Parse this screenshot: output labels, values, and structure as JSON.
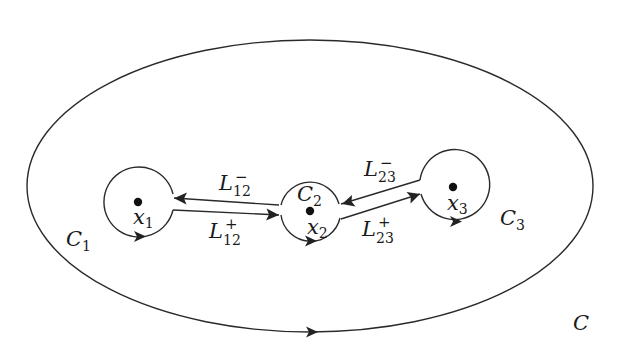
{
  "diagram": {
    "type": "contour-diagram",
    "outer_contour": {
      "label": "C",
      "center": [
        310,
        186
      ],
      "rx": 283,
      "ry": 146,
      "orientation": "counterclockwise-arrow-at-bottom-pointing-right"
    },
    "circles": [
      {
        "id": "C1",
        "label": "C",
        "label_sub": "1",
        "center": [
          139,
          202
        ],
        "r": 35,
        "point": {
          "label": "x",
          "label_sub": "1",
          "pos": [
            138,
            202
          ]
        }
      },
      {
        "id": "C2",
        "label": "C",
        "label_sub": "2",
        "center": [
          311,
          211
        ],
        "r": 30,
        "point": {
          "label": "x",
          "label_sub": "2",
          "pos": [
            310,
            211
          ]
        }
      },
      {
        "id": "C3",
        "label": "C",
        "label_sub": "3",
        "center": [
          455,
          187
        ],
        "r": 35,
        "point": {
          "label": "x",
          "label_sub": "3",
          "pos": [
            453,
            187
          ]
        }
      }
    ],
    "edges": [
      {
        "id": "L12-minus",
        "label": "L",
        "label_sub": "12",
        "label_sup": "−",
        "from": "C2",
        "to": "C1"
      },
      {
        "id": "L12-plus",
        "label": "L",
        "label_sub": "12",
        "label_sup": "+",
        "from": "C1",
        "to": "C2"
      },
      {
        "id": "L23-minus",
        "label": "L",
        "label_sub": "23",
        "label_sup": "−",
        "from": "C3",
        "to": "C2"
      },
      {
        "id": "L23-plus",
        "label": "L",
        "label_sub": "23",
        "label_sup": "+",
        "from": "C2",
        "to": "C3"
      }
    ]
  },
  "labels": {
    "C": "C",
    "C1": {
      "main": "C",
      "sub": "1"
    },
    "C2": {
      "main": "C",
      "sub": "2"
    },
    "C3": {
      "main": "C",
      "sub": "3"
    },
    "x1": {
      "main": "x",
      "sub": "1"
    },
    "x2": {
      "main": "x",
      "sub": "2"
    },
    "x3": {
      "main": "x",
      "sub": "3"
    },
    "L12m": {
      "main": "L",
      "sub": "12",
      "sup": "−"
    },
    "L12p": {
      "main": "L",
      "sub": "12",
      "sup": "+"
    },
    "L23m": {
      "main": "L",
      "sub": "23",
      "sup": "−"
    },
    "L23p": {
      "main": "L",
      "sub": "23",
      "sup": "+"
    }
  },
  "colors": {
    "stroke": "#2a2a2a",
    "dot": "#111111",
    "background": "#ffffff"
  }
}
